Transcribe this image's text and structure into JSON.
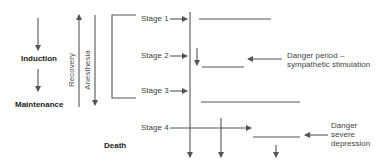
{
  "left_column": {
    "induction": "Induction",
    "maintenance": "Maintenance",
    "death": "Death"
  },
  "vertical_labels": {
    "recovery": "Recovery",
    "anesthesia": "Anesthesia"
  },
  "stages": [
    {
      "label": "Stage 1"
    },
    {
      "label": "Stage 2"
    },
    {
      "label": "Stage 3"
    },
    {
      "label": "Stage 4"
    }
  ],
  "annotations": {
    "danger_period_line1": "Danger period –",
    "danger_period_line2": "sympathetic stimulation",
    "danger_severe_line1": "Danger",
    "danger_severe_line2": "severe",
    "danger_severe_line3": "depression"
  },
  "colors": {
    "line": "#555555",
    "text": "#333333"
  }
}
